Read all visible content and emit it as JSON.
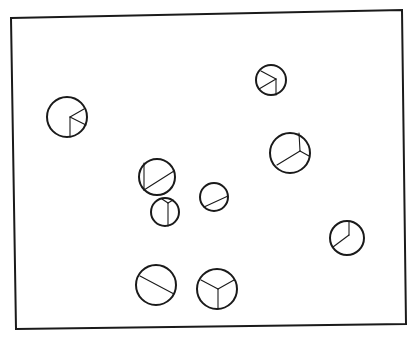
{
  "canvas": {
    "width": 414,
    "height": 340,
    "background": "#ffffff",
    "ink": "#1a1a1a"
  },
  "frame": {
    "points": [
      [
        11,
        18
      ],
      [
        402,
        10
      ],
      [
        406,
        324
      ],
      [
        16,
        329
      ]
    ]
  },
  "circles": [
    {
      "id": "circle-1",
      "cx": 67,
      "cy": 117,
      "r": 20,
      "segments": [
        [
          70,
          117,
          70,
          137
        ],
        [
          70,
          117,
          84,
          109
        ],
        [
          70,
          117,
          86,
          125
        ]
      ]
    },
    {
      "id": "circle-2",
      "cx": 271,
      "cy": 80,
      "r": 15,
      "segments": [
        [
          276,
          79,
          261,
          71
        ],
        [
          276,
          79,
          259,
          89
        ],
        [
          276,
          79,
          276,
          95
        ]
      ]
    },
    {
      "id": "circle-3",
      "cx": 290,
      "cy": 153,
      "r": 20,
      "segments": [
        [
          300,
          151,
          299,
          133
        ],
        [
          300,
          151,
          309,
          156
        ],
        [
          300,
          151,
          277,
          165
        ]
      ]
    },
    {
      "id": "circle-4",
      "cx": 157,
      "cy": 177,
      "r": 18,
      "segments": [
        [
          144,
          163,
          144,
          190
        ],
        [
          144,
          190,
          174,
          171
        ]
      ]
    },
    {
      "id": "circle-5",
      "cx": 165,
      "cy": 212,
      "r": 14,
      "segments": [
        [
          168,
          203,
          168,
          226
        ],
        [
          168,
          203,
          162,
          199
        ],
        [
          168,
          203,
          173,
          200
        ]
      ]
    },
    {
      "id": "circle-6",
      "cx": 214,
      "cy": 197,
      "r": 14,
      "segments": [
        [
          204,
          207,
          228,
          196
        ]
      ]
    },
    {
      "id": "circle-7",
      "cx": 347,
      "cy": 238,
      "r": 17,
      "segments": [
        [
          349,
          235,
          349,
          221
        ],
        [
          349,
          235,
          333,
          247
        ]
      ]
    },
    {
      "id": "circle-8",
      "cx": 156,
      "cy": 285,
      "r": 20,
      "segments": [
        [
          140,
          276,
          174,
          294
        ]
      ]
    },
    {
      "id": "circle-9",
      "cx": 217,
      "cy": 289,
      "r": 20,
      "segments": [
        [
          218,
          289,
          201,
          280
        ],
        [
          218,
          289,
          234,
          280
        ],
        [
          218,
          289,
          218,
          309
        ]
      ]
    }
  ]
}
